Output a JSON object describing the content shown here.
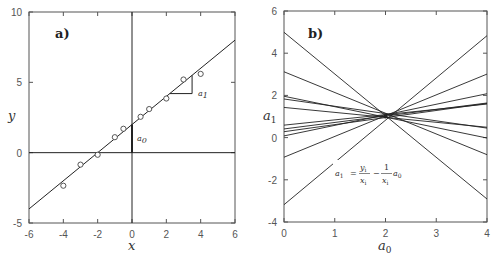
{
  "chart_data": [
    {
      "panel": "a)",
      "type": "scatter",
      "title": "",
      "xlabel": "x",
      "ylabel": "y",
      "xlim": [
        -6,
        6
      ],
      "ylim": [
        -5,
        10
      ],
      "xticks": [
        -6,
        -4,
        -2,
        0,
        2,
        4,
        6
      ],
      "yticks": [
        -5,
        0,
        5,
        10
      ],
      "grid": false,
      "points": [
        {
          "x": -4.0,
          "y": -2.35
        },
        {
          "x": -3.0,
          "y": -0.85
        },
        {
          "x": -2.0,
          "y": -0.15
        },
        {
          "x": -1.0,
          "y": 1.1
        },
        {
          "x": -0.5,
          "y": 1.7
        },
        {
          "x": 0.5,
          "y": 2.55
        },
        {
          "x": 1.0,
          "y": 3.1
        },
        {
          "x": 2.0,
          "y": 3.85
        },
        {
          "x": 3.0,
          "y": 5.2
        },
        {
          "x": 4.0,
          "y": 5.6
        }
      ],
      "fit_line": {
        "intercept": 2.0,
        "slope": 1.0
      },
      "annotations": [
        {
          "text": "a1",
          "meaning": "slope triangle",
          "x": 3.5,
          "y": 4.3
        },
        {
          "text": "a0",
          "meaning": "intercept segment at x=0",
          "x": 0.4,
          "y": 1.1
        }
      ]
    },
    {
      "panel": "b)",
      "type": "line",
      "title": "",
      "xlabel": "a0",
      "ylabel": "a1",
      "xlim": [
        0,
        4
      ],
      "ylim": [
        -4,
        6
      ],
      "xticks": [
        0,
        1,
        2,
        3,
        4
      ],
      "yticks": [
        -4,
        -2,
        0,
        2,
        4,
        6
      ],
      "grid": false,
      "equation": "a1 = yi/xi − (1/xi) a0",
      "series": [
        {
          "name": "x=-4",
          "a1_at_a0_0": 0.59,
          "a1_at_a0_4": 1.59
        },
        {
          "name": "x=-3",
          "a1_at_a0_0": 0.28,
          "a1_at_a0_4": 1.62
        },
        {
          "name": "x=-2",
          "a1_at_a0_0": 0.08,
          "a1_at_a0_4": 2.08
        },
        {
          "name": "x=-1",
          "a1_at_a0_0": -0.93,
          "a1_at_a0_4": 3.01
        },
        {
          "name": "x=-0.5",
          "a1_at_a0_0": -3.18,
          "a1_at_a0_4": 4.83
        },
        {
          "name": "x=0.5",
          "a1_at_a0_0": 4.99,
          "a1_at_a0_4": -2.91
        },
        {
          "name": "x=1",
          "a1_at_a0_0": 3.12,
          "a1_at_a0_4": -0.81
        },
        {
          "name": "x=2",
          "a1_at_a0_0": 1.96,
          "a1_at_a0_4": -0.02
        },
        {
          "name": "x=3",
          "a1_at_a0_0": 1.83,
          "a1_at_a0_4": 0.45
        },
        {
          "name": "x=4",
          "a1_at_a0_0": 1.43,
          "a1_at_a0_4": 0.49
        },
        {
          "name": "extra",
          "a1_at_a0_0": 0.41,
          "a1_at_a0_4": 1.64
        }
      ],
      "intersection": {
        "a0": 2.0,
        "a1": 1.0
      }
    }
  ],
  "labels": {
    "panel_a": "a)",
    "panel_b": "b)",
    "a_xlabel": "x",
    "a_ylabel": "y",
    "b_xlabel": "a",
    "b_xlabel_sub": "0",
    "b_ylabel": "a",
    "b_ylabel_sub": "1",
    "anno_a1": "a",
    "anno_a1_sub": "1",
    "anno_a0": "a",
    "anno_a0_sub": "0",
    "eq_lhs": "a",
    "eq_lhs_sub": "1",
    "eq_eq": "=",
    "eq_num1": "y",
    "eq_num1_sub": "i",
    "eq_den1": "x",
    "eq_den1_sub": "i",
    "eq_minus": "−",
    "eq_num2": "1",
    "eq_den2": "x",
    "eq_den2_sub": "i",
    "eq_tail": "a",
    "eq_tail_sub": "0"
  },
  "colors": {
    "line": "#222222",
    "frame": "#555555",
    "marker": "#444444"
  }
}
